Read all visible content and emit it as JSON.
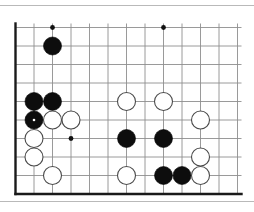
{
  "figure": {
    "kind": "go-board-diagram",
    "background_color": "#ffffff",
    "rules": {
      "color": "#b9b9b9",
      "top_y": 5,
      "bottom_y": 201
    }
  },
  "board": {
    "origin_x": 15.5,
    "origin_y": 27.5,
    "cell": 18.5,
    "cols": 12,
    "rows": 9,
    "line_color": "#8e8e8e",
    "line_width": 0.9,
    "edge_color": "#1a1a1a",
    "edge_width": 2.4,
    "edges": [
      "left",
      "bottom"
    ],
    "star_points": [
      {
        "col": 2,
        "row": 0
      },
      {
        "col": 8,
        "row": 0
      },
      {
        "col": 3,
        "row": 6
      }
    ],
    "star_radius": 2.4,
    "star_color": "#111111"
  },
  "stones": {
    "radius": 9.0,
    "black_fill": "#0d0d0d",
    "black_stroke": "#000000",
    "white_fill": "#ffffff",
    "white_stroke": "#4a4a4a",
    "white_stroke_width": 1.1,
    "marker_color": "#ffffff",
    "marker_radius": 1.3,
    "list": [
      {
        "id": "b1",
        "color": "black",
        "col": 2,
        "row": 1,
        "marked": false
      },
      {
        "id": "b2",
        "color": "black",
        "col": 1,
        "row": 4,
        "marked": false
      },
      {
        "id": "b3",
        "color": "black",
        "col": 2,
        "row": 4,
        "marked": false
      },
      {
        "id": "b4",
        "color": "black",
        "col": 1,
        "row": 5,
        "marked": true
      },
      {
        "id": "w1",
        "color": "white",
        "col": 2,
        "row": 5,
        "marked": false
      },
      {
        "id": "w2",
        "color": "white",
        "col": 3,
        "row": 5,
        "marked": false
      },
      {
        "id": "w3",
        "color": "white",
        "col": 1,
        "row": 6,
        "marked": false
      },
      {
        "id": "w4",
        "color": "white",
        "col": 1,
        "row": 7,
        "marked": false
      },
      {
        "id": "w5",
        "color": "white",
        "col": 2,
        "row": 8,
        "marked": false
      },
      {
        "id": "w6",
        "color": "white",
        "col": 6,
        "row": 4,
        "marked": false
      },
      {
        "id": "w7",
        "color": "white",
        "col": 8,
        "row": 4,
        "marked": false
      },
      {
        "id": "w8",
        "color": "white",
        "col": 10,
        "row": 5,
        "marked": false
      },
      {
        "id": "b5",
        "color": "black",
        "col": 6,
        "row": 6,
        "marked": false
      },
      {
        "id": "b6",
        "color": "black",
        "col": 8,
        "row": 6,
        "marked": false
      },
      {
        "id": "w9",
        "color": "white",
        "col": 10,
        "row": 7,
        "marked": false
      },
      {
        "id": "w10",
        "color": "white",
        "col": 6,
        "row": 8,
        "marked": false
      },
      {
        "id": "b7",
        "color": "black",
        "col": 8,
        "row": 8,
        "marked": false
      },
      {
        "id": "b8",
        "color": "black",
        "col": 9,
        "row": 8,
        "marked": false
      },
      {
        "id": "w11",
        "color": "white",
        "col": 10,
        "row": 8,
        "marked": false
      }
    ]
  }
}
